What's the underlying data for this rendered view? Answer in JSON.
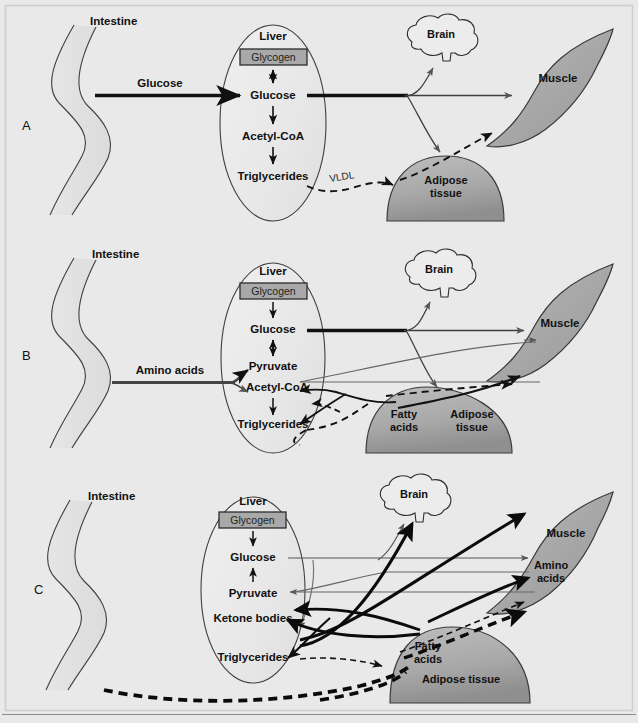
{
  "figure": {
    "background_color": "#e9e9e9",
    "organ_colors": {
      "liver_fill": "#ececec",
      "intestine_fill": "#e4e4e4",
      "muscle_fill": "#a8a8a8",
      "adipose_fill": "#a8a8a8",
      "brain_fill": "#ebebeb",
      "glycogen_fill": "#a9a9a9",
      "outline": "#3a3a3a",
      "arrow_dark": "#111111",
      "arrow_thin": "#555555"
    }
  },
  "panels": [
    {
      "id": "A",
      "letter": "A",
      "organs": {
        "intestine": "Intestine",
        "liver": "Liver",
        "brain": "Brain",
        "muscle": "Muscle",
        "adipose": "Adipose\ntissue",
        "adipose_line1": "Adipose",
        "adipose_line2": "tissue"
      },
      "liver_metabolites": {
        "glycogen": "Glycogen",
        "glucose": "Glucose",
        "acetyl_coa": "Acetyl-CoA",
        "triglycerides": "Triglycerides"
      },
      "flux_labels": {
        "intestine_to_liver": "Glucose",
        "vldl": "VLDL"
      }
    },
    {
      "id": "B",
      "letter": "B",
      "organs": {
        "intestine": "Intestine",
        "liver": "Liver",
        "brain": "Brain",
        "muscle": "Muscle",
        "adipose_line1": "Adipose",
        "adipose_line2": "tissue",
        "fatty_acids_line1": "Fatty",
        "fatty_acids_line2": "acids"
      },
      "liver_metabolites": {
        "glycogen": "Glycogen",
        "glucose": "Glucose",
        "pyruvate": "Pyruvate",
        "acetyl_coa": "Acetyl-CoA",
        "triglycerides": "Triglycerides"
      },
      "flux_labels": {
        "intestine_to_liver": "Amino acids"
      }
    },
    {
      "id": "C",
      "letter": "C",
      "organs": {
        "intestine": "Intestine",
        "liver": "Liver",
        "brain": "Brain",
        "muscle": "Muscle",
        "muscle_amino_line1": "Amino",
        "muscle_amino_line2": "acids",
        "adipose": "Adipose tissue",
        "fatty_acids_line1": "Fatty",
        "fatty_acids_line2": "acids"
      },
      "liver_metabolites": {
        "glycogen": "Glycogen",
        "glucose": "Glucose",
        "pyruvate": "Pyruvate",
        "ketone_bodies": "Ketone bodies",
        "triglycerides": "Triglycerides"
      },
      "flux_labels": {}
    }
  ]
}
